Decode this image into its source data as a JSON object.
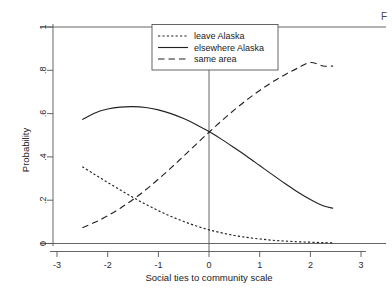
{
  "chart_data": {
    "type": "line",
    "title": "",
    "xlabel": "Social ties to community scale",
    "ylabel": "Probability",
    "xlim": [
      -3.15,
      3.15
    ],
    "ylim": [
      0,
      1
    ],
    "xticks": [
      -3,
      -2,
      -1,
      0,
      1,
      2,
      3
    ],
    "xtick_labels": [
      "-3",
      "-2",
      "-1",
      "0",
      "1",
      "2",
      "3"
    ],
    "yticks": [
      0,
      0.2,
      0.4,
      0.6,
      0.8,
      1
    ],
    "ytick_labels": [
      "0",
      ".2",
      ".4",
      ".6",
      ".8",
      "1"
    ],
    "grid": false,
    "legend_position": "top-center",
    "reference_lines": [
      {
        "name": "x-zero-vertical",
        "orientation": "vertical",
        "value": 0
      },
      {
        "name": "y-one-horizontal",
        "orientation": "horizontal",
        "value": 1
      },
      {
        "name": "y-zero-horizontal",
        "orientation": "horizontal",
        "value": 0
      }
    ],
    "x": [
      -2.5,
      -2.25,
      -2.0,
      -1.75,
      -1.5,
      -1.25,
      -1.0,
      -0.75,
      -0.5,
      -0.25,
      0.0,
      0.25,
      0.5,
      0.75,
      1.0,
      1.25,
      1.5,
      1.75,
      2.0,
      2.25,
      2.45
    ],
    "series": [
      {
        "name": "leave Alaska",
        "style": "dotted",
        "values": [
          0.355,
          0.318,
          0.282,
          0.247,
          0.213,
          0.181,
          0.152,
          0.125,
          0.102,
          0.081,
          0.063,
          0.049,
          0.037,
          0.028,
          0.021,
          0.015,
          0.011,
          0.008,
          0.006,
          0.004,
          0.003
        ]
      },
      {
        "name": "elsewhere Alaska",
        "style": "solid",
        "values": [
          0.572,
          0.603,
          0.621,
          0.63,
          0.632,
          0.628,
          0.617,
          0.6,
          0.577,
          0.549,
          0.517,
          0.481,
          0.442,
          0.402,
          0.36,
          0.318,
          0.277,
          0.238,
          0.203,
          0.174,
          0.163
        ]
      },
      {
        "name": "same area",
        "style": "dashed",
        "values": [
          0.073,
          0.098,
          0.128,
          0.163,
          0.203,
          0.248,
          0.297,
          0.349,
          0.404,
          0.459,
          0.514,
          0.567,
          0.617,
          0.664,
          0.707,
          0.746,
          0.78,
          0.81,
          0.836,
          0.82,
          0.82
        ]
      }
    ]
  },
  "legend": {
    "items": [
      {
        "label": "leave Alaska",
        "style": "dotted"
      },
      {
        "label": "elsewhere Alaska",
        "style": "solid"
      },
      {
        "label": "same area",
        "style": "dashed"
      }
    ]
  },
  "corner": {
    "mark": "F"
  },
  "colors": {
    "line": "#222222",
    "axis": "#555555",
    "background": "#ffffff"
  }
}
